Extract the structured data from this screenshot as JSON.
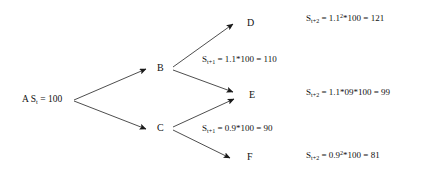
{
  "diagram": {
    "type": "binomial-recombining-tree",
    "background_color": "#ffffff",
    "line_color": "#3a3a3a",
    "text_color": "#111111",
    "root": {
      "name": "A",
      "prefix": "A S",
      "sub": "t",
      "suffix": " = 100",
      "full_text": "A S_t = 100",
      "value": 100
    },
    "nodes": [
      {
        "id": "B",
        "label": "B"
      },
      {
        "id": "C",
        "label": "C"
      },
      {
        "id": "D",
        "label": "D"
      },
      {
        "id": "E",
        "label": "E"
      },
      {
        "id": "F",
        "label": "F"
      }
    ],
    "edge_labels": [
      {
        "id": "up-step",
        "lead": "S",
        "sub": "t+1",
        "rest": " = 1.1*100 = 110",
        "full_text": "S_t+1 = 1.1*100 = 110",
        "factor": 1.1,
        "result": 110
      },
      {
        "id": "down-step",
        "lead": "S",
        "sub": "t+1",
        "rest": " = 0.9*100 = 90",
        "full_text": "S_t+1 = 0.9*100 = 90",
        "factor": 0.9,
        "result": 90
      }
    ],
    "formulas": [
      {
        "id": "up-up",
        "for_node": "D",
        "lead": "S",
        "sub": "t+2",
        "mid": " = 1.1",
        "sup": "2",
        "rest": "*100 = 121",
        "full_text": "S_t+2 = 1.1^2*100 = 121",
        "result": 121
      },
      {
        "id": "mixed",
        "for_node": "E",
        "lead": "S",
        "sub": "t+2",
        "mid": " = 1.1*09*100 = 99",
        "sup": "",
        "rest": "",
        "full_text": "S_t+2 = 1.1*09*100 = 99",
        "result": 99
      },
      {
        "id": "down-down",
        "for_node": "F",
        "lead": "S",
        "sub": "t+2",
        "mid": " = 0.9",
        "sup": "2",
        "rest": "*100 = 81",
        "full_text": "S_t+2 = 0.9^2*100 = 81",
        "result": 81
      }
    ]
  }
}
